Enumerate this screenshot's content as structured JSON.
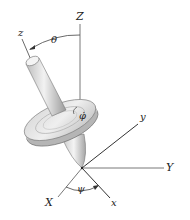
{
  "diagram": {
    "type": "gyroscope-euler-angles",
    "labels": {
      "Z": "Z",
      "z": "z",
      "theta": "θ",
      "phi_dot": "φ̇",
      "y": "y",
      "Y": "Y",
      "X": "X",
      "x": "x",
      "psi": "ψ"
    },
    "colors": {
      "axis": "#444444",
      "rod_light": "#e6e6e6",
      "rod_dark": "#9a9a9a",
      "disk_light": "#e9e9e9",
      "disk_dark": "#a8a8a8",
      "outline": "#555555"
    }
  }
}
